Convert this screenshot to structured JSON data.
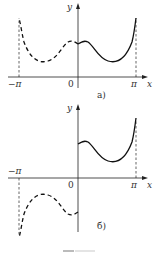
{
  "figures": [
    {
      "id": "a",
      "caption": "а)",
      "caption_display": "a)",
      "axis_labels": {
        "x": "x",
        "y": "y"
      },
      "tick_labels": {
        "neg_pi": "−π",
        "zero": "0",
        "pi": "π"
      },
      "description": "Even extension: solid curve on (0, π), dashed mirror on (−π, 0)"
    },
    {
      "id": "b",
      "caption": "б)",
      "axis_labels": {
        "x": "x",
        "y": "y"
      },
      "tick_labels": {
        "neg_pi": "−π",
        "zero": "0",
        "pi": "π"
      },
      "description": "Odd extension: solid curve on (0, π), dashed point-symmetric copy on (−π, 0)"
    }
  ],
  "colors": {
    "line": "#1a1a1a",
    "text": "#333333"
  }
}
